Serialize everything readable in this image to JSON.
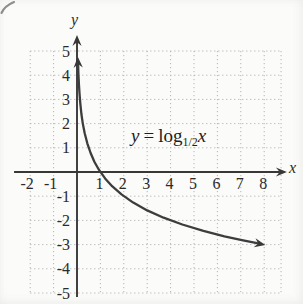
{
  "page": {
    "decorations": [
      "partial-pen-stroke-top-left"
    ]
  },
  "chart_data": {
    "type": "line",
    "title": "",
    "xlabel": "x",
    "ylabel": "y",
    "equation": {
      "lhs": "y",
      "rel": "=",
      "fn": "log",
      "base": "1/2",
      "arg": "x"
    },
    "xlim": [
      -2.69,
      8.97
    ],
    "ylim": [
      -5.17,
      5.66
    ],
    "grid_xlim": [
      -2,
      8.72
    ],
    "grid_ylim": [
      -5,
      5
    ],
    "grid": true,
    "x_ticks": [
      -2,
      -1,
      1,
      2,
      3,
      4,
      5,
      6,
      7,
      8
    ],
    "y_ticks": [
      5,
      4,
      3,
      2,
      1,
      -1,
      -2,
      -3,
      -4,
      -5
    ],
    "series": [
      {
        "name": "y = log base 1/2 of x",
        "arrow_start": true,
        "arrow_end": true,
        "points": [
          [
            0.045,
            4.474
          ],
          [
            0.06,
            4.059
          ],
          [
            0.08,
            3.644
          ],
          [
            0.105,
            3.252
          ],
          [
            0.14,
            2.837
          ],
          [
            0.19,
            2.396
          ],
          [
            0.25,
            2.0
          ],
          [
            0.33,
            1.6
          ],
          [
            0.44,
            1.184
          ],
          [
            0.58,
            0.786
          ],
          [
            0.75,
            0.415
          ],
          [
            0.95,
            0.074
          ],
          [
            1.2,
            -0.263
          ],
          [
            1.5,
            -0.585
          ],
          [
            1.9,
            -0.926
          ],
          [
            2.4,
            -1.263
          ],
          [
            3.0,
            -1.585
          ],
          [
            3.7,
            -1.888
          ],
          [
            4.5,
            -2.17
          ],
          [
            5.4,
            -2.433
          ],
          [
            6.3,
            -2.655
          ],
          [
            7.1,
            -2.828
          ],
          [
            7.8,
            -2.964
          ]
        ],
        "key_points": [
          [
            1,
            0
          ],
          [
            2,
            -1
          ],
          [
            4,
            -2
          ],
          [
            8,
            -3
          ]
        ]
      }
    ],
    "style": {
      "curve_color": "#3d3d3d",
      "axis_color": "#383838",
      "grid_color": "#b4b4b4",
      "label_color": "#2b2b2b",
      "background": "#fbfbf9"
    }
  }
}
